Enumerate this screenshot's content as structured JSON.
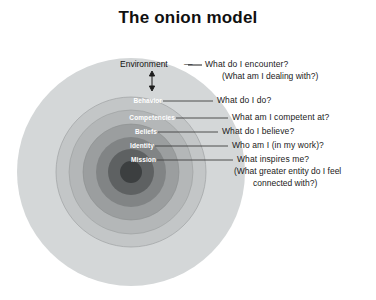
{
  "title": "The onion model",
  "colors": {
    "background": "#ffffff",
    "ring_environment": "#d4d7d8",
    "ring_behavior": "#c3c6c7",
    "ring_competencies": "#b4b7b8",
    "ring_beliefs": "#9b9e9f",
    "ring_identity": "#818485",
    "ring_mission": "#5e6162",
    "ring_core": "#3c3f40",
    "label_text": "#ffffff",
    "question_text": "#1a1a1a",
    "leader_line": "#4a4a4a",
    "title_text": "#101010"
  },
  "diagram": {
    "type": "concentric-onion",
    "center_x": 131,
    "center_y": 172,
    "layers": [
      {
        "name": "Environment",
        "label": "Environment",
        "radius": 114,
        "fill": "#d4d7d8",
        "question": "What do I encounter?",
        "question_sub": "(What am I dealing with?)"
      },
      {
        "name": "Behavior",
        "label": "Behavior",
        "radius": 75,
        "fill": "#c3c6c7",
        "question": "What do I do?",
        "question_sub": ""
      },
      {
        "name": "Competencies",
        "label": "Competencies",
        "radius": 62,
        "fill": "#b4b7b8",
        "question": "What am I competent at?",
        "question_sub": ""
      },
      {
        "name": "Beliefs",
        "label": "Beliefs",
        "radius": 48,
        "fill": "#9b9e9f",
        "question": "What do I believe?",
        "question_sub": ""
      },
      {
        "name": "Identity",
        "label": "Identity",
        "radius": 35,
        "fill": "#818485",
        "question": "Who am I (in my work)?",
        "question_sub": ""
      },
      {
        "name": "Mission",
        "label": "Mission",
        "radius": 23,
        "fill": "#5e6162",
        "question": "What inspires me?",
        "question_sub": "(What greater entity do I feel",
        "question_sub2": "connected with?)"
      },
      {
        "name": "Core",
        "label": "",
        "radius": 11,
        "fill": "#3c3f40",
        "question": "",
        "question_sub": ""
      }
    ],
    "environment_dash": "—",
    "arrow": "environment-arrow"
  }
}
